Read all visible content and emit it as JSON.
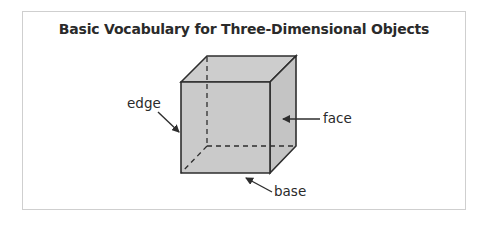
{
  "title": "Basic Vocabulary for Three-Dimensional Objects",
  "labels": {
    "edge": "edge",
    "face": "face",
    "base": "base"
  },
  "colors": {
    "cube_fill": "#c9c9c9",
    "stroke": "#2e2e2e",
    "border": "#cfcfcf"
  }
}
